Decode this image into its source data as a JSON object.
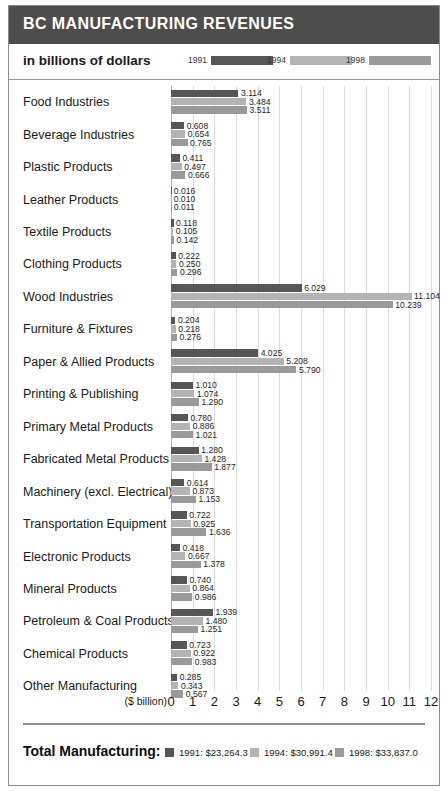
{
  "header": {
    "title": "BC MANUFACTURING REVENUES",
    "caption": "in billions of dollars"
  },
  "legend": {
    "items": [
      {
        "label": "1991",
        "color": "#565656"
      },
      {
        "label": "1994",
        "color": "#b4b4b4"
      },
      {
        "label": "1998",
        "color": "#9a9a9a"
      }
    ]
  },
  "axis": {
    "unit_label": "($ billion)",
    "ticks": [
      "0",
      "1",
      "2",
      "3",
      "4",
      "5",
      "6",
      "7",
      "8",
      "9",
      "10",
      "11",
      "12"
    ]
  },
  "footer": {
    "title": "Total Manufacturing:",
    "totals": [
      {
        "label": "1991: $23,264.3",
        "color": "#565656"
      },
      {
        "label": "1994: $30,991.4",
        "color": "#b4b4b4"
      },
      {
        "label": "1998: $33,837.0",
        "color": "#9a9a9a"
      }
    ]
  },
  "chart_data": {
    "type": "bar",
    "orientation": "horizontal",
    "title": "BC MANUFACTURING REVENUES",
    "subtitle": "in billions of dollars",
    "xlabel": "($ billion)",
    "ylabel": "",
    "xlim": [
      0,
      12
    ],
    "grid": true,
    "legend_position": "top",
    "categories": [
      "Food Industries",
      "Beverage Industries",
      "Plastic Products",
      "Leather Products",
      "Textile Products",
      "Clothing Products",
      "Wood Industries",
      "Furniture & Fixtures",
      "Paper & Allied Products",
      "Printing & Publishing",
      "Primary Metal Products",
      "Fabricated Metal Products",
      "Machinery (excl. Electrical)",
      "Transportation Equipment",
      "Electronic Products",
      "Mineral Products",
      "Petroleum & Coal Products",
      "Chemical Products",
      "Other Manufacturing"
    ],
    "series": [
      {
        "name": "1991",
        "color": "#565656",
        "values": [
          3.114,
          0.608,
          0.411,
          0.016,
          0.118,
          0.222,
          6.029,
          0.204,
          4.025,
          1.01,
          0.78,
          1.28,
          0.614,
          0.722,
          0.418,
          0.74,
          1.939,
          0.723,
          0.285
        ],
        "labels": [
          "3.114",
          "0.608",
          "0.411",
          "0.016",
          "0.118",
          "0.222",
          "6.029",
          "0.204",
          "4.025",
          "1.010",
          "0.780",
          "1.280",
          "0.614",
          "0.722",
          "0.418",
          "0.740",
          "1.939",
          "0.723",
          "0.285"
        ]
      },
      {
        "name": "1994",
        "color": "#b4b4b4",
        "values": [
          3.484,
          0.654,
          0.497,
          0.01,
          0.105,
          0.25,
          11.104,
          0.218,
          5.208,
          1.074,
          0.886,
          1.428,
          0.873,
          0.925,
          0.667,
          0.864,
          1.48,
          0.922,
          0.343
        ],
        "labels": [
          "3.484",
          "0.654",
          "0.497",
          "0.010",
          "0.105",
          "0.250",
          "11.104",
          "0.218",
          "5.208",
          "1.074",
          "0.886",
          "1.428",
          "0.873",
          "0.925",
          "0.667",
          "0.864",
          "1.480",
          "0.922",
          "0.343"
        ]
      },
      {
        "name": "1998",
        "color": "#9a9a9a",
        "values": [
          3.511,
          0.765,
          0.666,
          0.011,
          0.142,
          0.296,
          10.239,
          0.276,
          5.79,
          1.29,
          1.021,
          1.877,
          1.153,
          1.636,
          1.378,
          0.986,
          1.251,
          0.983,
          0.567
        ],
        "labels": [
          "3.511",
          "0.765",
          "0.666",
          "0.011",
          "0.142",
          "0.296",
          "10.239",
          "0.276",
          "5.790",
          "1.290",
          "1.021",
          "1.877",
          "1.153",
          "1.636",
          "1.378",
          "0.986",
          "1.251",
          "0.983",
          "0.567"
        ]
      }
    ],
    "totals": {
      "1991": "$23,264.3",
      "1994": "$30,991.4",
      "1998": "$33,837.0"
    }
  }
}
